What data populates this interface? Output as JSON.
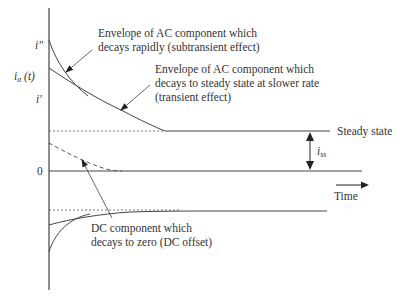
{
  "diagram": {
    "title": "",
    "colors": {
      "line": "#444444",
      "text": "#333333",
      "dash": "#555555",
      "background": "#ffffff"
    },
    "axis_labels": {
      "y_subtransient": "i\"",
      "y_current_main": "i",
      "y_current_sub": "a",
      "y_current_tail": " (t)",
      "y_transient": "i'",
      "zero": "0",
      "x_time": "Time"
    },
    "annotations": {
      "subtransient_line1": "Envelope of AC component which",
      "subtransient_line2": "decays rapidly (subtransient effect)",
      "transient_line1": "Envelope of AC component which",
      "transient_line2": "decays to steady state at slower rate",
      "transient_line3": "(transient effect)",
      "steady_state": "Steady state",
      "iss_main": "i",
      "iss_sub": "ss",
      "dc_line1": "DC component which",
      "dc_line2": "decays to zero (DC offset)"
    }
  }
}
